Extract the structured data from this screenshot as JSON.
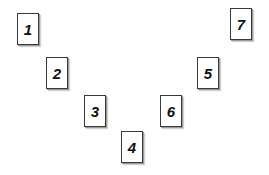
{
  "diagram": {
    "layout": "V-shape arrangement of numbered cards",
    "cards": [
      {
        "label": "1",
        "x": 17,
        "y": 13
      },
      {
        "label": "2",
        "x": 46,
        "y": 57
      },
      {
        "label": "3",
        "x": 84,
        "y": 95
      },
      {
        "label": "4",
        "x": 121,
        "y": 131
      },
      {
        "label": "5",
        "x": 197,
        "y": 57
      },
      {
        "label": "6",
        "x": 160,
        "y": 95
      },
      {
        "label": "7",
        "x": 230,
        "y": 8
      }
    ]
  }
}
